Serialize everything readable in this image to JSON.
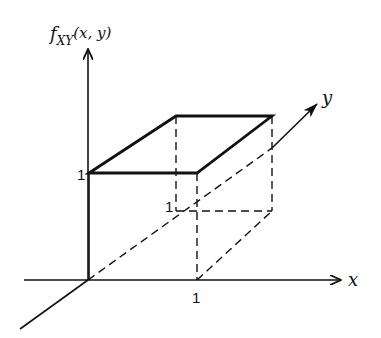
{
  "diagram": {
    "axes": {
      "z_label": "f",
      "z_label_sub": "XY",
      "z_label_args": "(x, y)",
      "x_label": "x",
      "y_label": "y"
    },
    "ticks": {
      "z_one": "1",
      "x_one": "1",
      "y_one": "1"
    },
    "colors": {
      "stroke": "#111111",
      "background": "#ffffff"
    }
  }
}
